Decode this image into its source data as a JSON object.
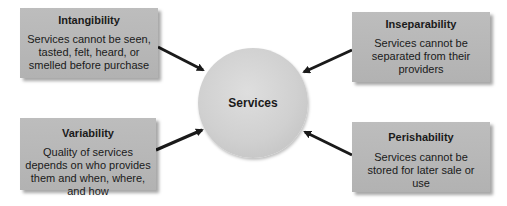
{
  "center": {
    "label": "Services"
  },
  "characteristics": [
    {
      "position": "top-left",
      "title": "Intangibility",
      "description": "Services cannot be seen, tasted, felt, heard, or smelled before purchase"
    },
    {
      "position": "top-right",
      "title": "Inseparability",
      "description": "Services cannot be separated from their providers"
    },
    {
      "position": "bottom-left",
      "title": "Variability",
      "description": "Quality of services depends on who provides them and when, where, and how"
    },
    {
      "position": "bottom-right",
      "title": "Perishability",
      "description": "Services cannot be stored for later sale or use"
    }
  ],
  "colors": {
    "box_fill": "#b8b8b8",
    "circle_fill": "#d4d4d4",
    "arrow": "#1a1a1a",
    "text": "#1a1a1a"
  }
}
